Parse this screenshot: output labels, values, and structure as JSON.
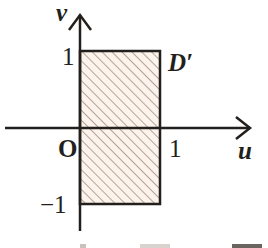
{
  "figure": {
    "region_label": "D′",
    "axes": {
      "x_label": "u",
      "y_label": "v",
      "origin_label": "O",
      "x_ticks": [
        {
          "value": 1,
          "label": "1"
        }
      ],
      "y_ticks": [
        {
          "value": 1,
          "label": "1"
        },
        {
          "value": -1,
          "label": "−1"
        }
      ]
    },
    "region": {
      "shape": "rectangle",
      "u_range": [
        0,
        1
      ],
      "v_range": [
        -1,
        1
      ],
      "fill": "hatched"
    },
    "colors": {
      "stroke": "#231f1c",
      "hatch": "#b5a398",
      "fill_background": "#fbf3ec"
    }
  }
}
